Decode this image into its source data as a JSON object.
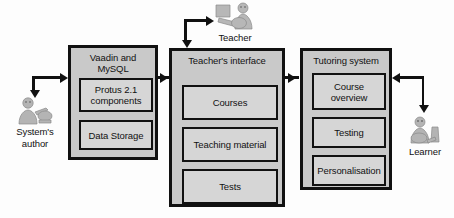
{
  "diagram": {
    "colors": {
      "outer_fill": "#c9c9c9",
      "inner_fill": "#d6d6d6",
      "stroke": "#111111",
      "background": "#fdfdfd"
    },
    "actors": [
      {
        "id": "systems-author",
        "label_line1": "System's",
        "label_line2": "author",
        "icon": "person-at-computer-icon"
      },
      {
        "id": "teacher",
        "label_line1": "Teacher",
        "label_line2": "",
        "icon": "person-at-computer-icon"
      },
      {
        "id": "learner",
        "label_line1": "Learner",
        "label_line2": "",
        "icon": "person-at-computer-icon"
      }
    ],
    "modules": [
      {
        "id": "vaadin-mysql",
        "title_line1": "Vaadin and",
        "title_line2": "MySQL",
        "components": [
          {
            "id": "protus-components",
            "label_line1": "Protus 2.1",
            "label_line2": "components"
          },
          {
            "id": "data-storage",
            "label_line1": "Data Storage",
            "label_line2": ""
          }
        ]
      },
      {
        "id": "teachers-interface",
        "title_line1": "Teacher's interface",
        "title_line2": "",
        "components": [
          {
            "id": "courses",
            "label_line1": "Courses",
            "label_line2": ""
          },
          {
            "id": "teaching-material",
            "label_line1": "Teaching material",
            "label_line2": ""
          },
          {
            "id": "tests",
            "label_line1": "Tests",
            "label_line2": ""
          }
        ]
      },
      {
        "id": "tutoring-system",
        "title_line1": "Tutoring system",
        "title_line2": "",
        "components": [
          {
            "id": "course-overview",
            "label_line1": "Course",
            "label_line2": "overview"
          },
          {
            "id": "testing",
            "label_line1": "Testing",
            "label_line2": ""
          },
          {
            "id": "personalisation",
            "label_line1": "Personalisation",
            "label_line2": ""
          }
        ]
      }
    ]
  }
}
